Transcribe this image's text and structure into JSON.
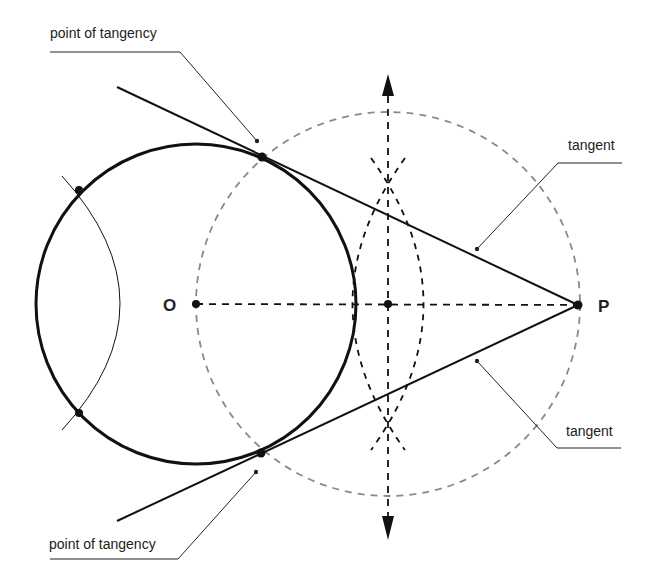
{
  "diagram": {
    "colors": {
      "ink": "#111111",
      "construction_gray": "#8a8a8a",
      "label": "#222222",
      "background": "#ffffff"
    },
    "points": {
      "O": {
        "label": "O",
        "x": 196,
        "y": 304
      },
      "P": {
        "label": "P",
        "x": 578,
        "y": 305
      },
      "M": {
        "x": 388,
        "y": 304
      },
      "T1": {
        "x": 262,
        "y": 157
      },
      "T2": {
        "x": 261,
        "y": 453
      },
      "A1": {
        "x": 79,
        "y": 190
      },
      "A2": {
        "x": 79,
        "y": 413
      }
    },
    "main_circle": {
      "cx": 196,
      "cy": 304,
      "r": 160
    },
    "construction_circle": {
      "cx": 388,
      "cy": 304,
      "r": 192
    },
    "labels": {
      "point_of_tangency_top": "point of tangency",
      "point_of_tangency_bottom": "point of tangency",
      "tangent_top": "tangent",
      "tangent_bottom": "tangent",
      "O": "O",
      "P": "P"
    }
  }
}
